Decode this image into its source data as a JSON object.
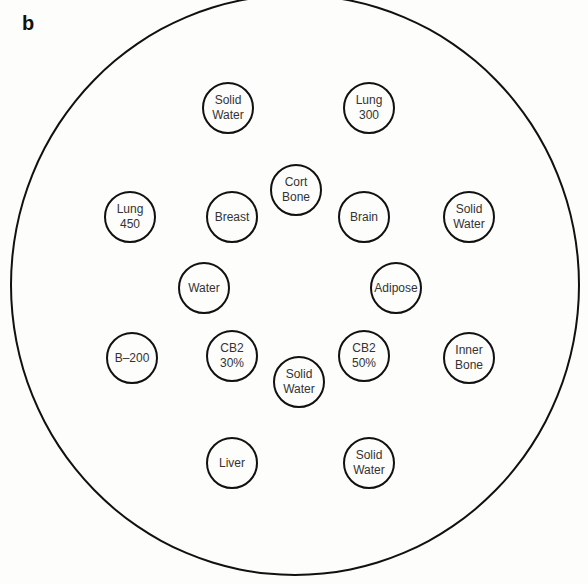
{
  "panel_label": "b",
  "phantom": {
    "inserts": [
      {
        "label": "Solid\nWater",
        "x": 228,
        "y": 108
      },
      {
        "label": "Lung\n300",
        "x": 369,
        "y": 108
      },
      {
        "label": "Cort\nBone",
        "x": 296,
        "y": 190
      },
      {
        "label": "Lung\n450",
        "x": 130,
        "y": 217
      },
      {
        "label": "Breast",
        "x": 232,
        "y": 217
      },
      {
        "label": "Brain",
        "x": 364,
        "y": 217
      },
      {
        "label": "Solid\nWater",
        "x": 469,
        "y": 217
      },
      {
        "label": "Water",
        "x": 204,
        "y": 288
      },
      {
        "label": "Adipose",
        "x": 396,
        "y": 288
      },
      {
        "label": "B–200",
        "x": 132,
        "y": 358
      },
      {
        "label": "CB2\n30%",
        "x": 232,
        "y": 356
      },
      {
        "label": "Solid\nWater",
        "x": 299,
        "y": 382
      },
      {
        "label": "CB2\n50%",
        "x": 364,
        "y": 356
      },
      {
        "label": "Inner\nBone",
        "x": 469,
        "y": 358
      },
      {
        "label": "Liver",
        "x": 232,
        "y": 463
      },
      {
        "label": "Solid\nWater",
        "x": 369,
        "y": 463
      }
    ]
  }
}
